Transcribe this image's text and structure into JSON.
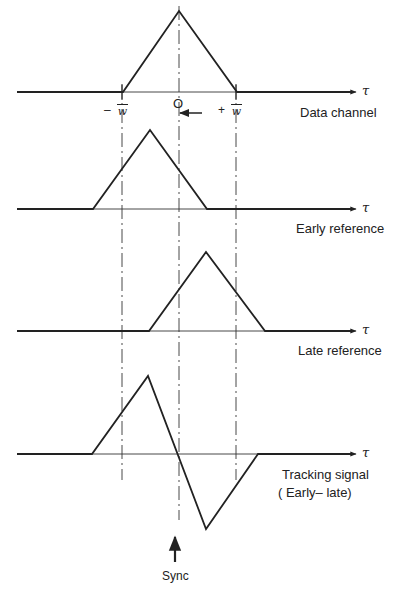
{
  "diagram": {
    "axis_symbol": "τ",
    "traces": [
      {
        "name": "data-channel",
        "label": "Data channel",
        "baseline_y": 92,
        "points": [
          [
            17,
            92
          ],
          [
            123,
            92
          ],
          [
            179,
            11
          ],
          [
            237,
            92
          ],
          [
            352,
            92
          ]
        ]
      },
      {
        "name": "early-reference",
        "label": "Early reference",
        "baseline_y": 209,
        "points": [
          [
            17,
            209
          ],
          [
            93,
            209
          ],
          [
            150,
            130
          ],
          [
            207,
            209
          ],
          [
            352,
            209
          ]
        ]
      },
      {
        "name": "late-reference",
        "label": "Late reference",
        "baseline_y": 331,
        "points": [
          [
            17,
            331
          ],
          [
            149,
            331
          ],
          [
            206,
            252
          ],
          [
            265,
            331
          ],
          [
            352,
            331
          ]
        ]
      },
      {
        "name": "tracking-signal",
        "label_line1": "Tracking signal",
        "label_line2": "( Early– late)",
        "baseline_y": 454,
        "points": [
          [
            17,
            454
          ],
          [
            92,
            454
          ],
          [
            148,
            376
          ],
          [
            206,
            529
          ],
          [
            258,
            454
          ],
          [
            352,
            454
          ]
        ]
      }
    ],
    "marks": {
      "zero": "O",
      "minus": "–",
      "plus": "+",
      "numerator": "1",
      "denominator": "w"
    },
    "sync_label": "Sync",
    "stroke_color": "#222222"
  }
}
